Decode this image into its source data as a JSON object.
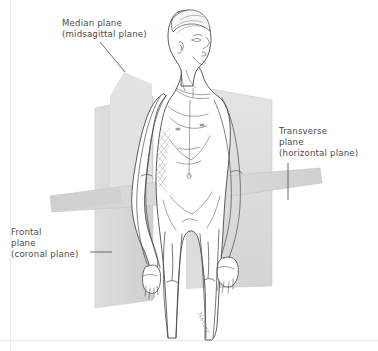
{
  "figure": {
    "background_color": "#ffffff",
    "plane_fill_color": "#d9d9d9",
    "outline_color": "#3a3a3a",
    "label_color": "#4a4a4a",
    "border_color": "#ebebeb",
    "signature": "Netter"
  },
  "labels": {
    "median": {
      "line1": "Median plane",
      "line2": "(midsagittal plane)",
      "leader": "diagonal-line-down-right"
    },
    "transverse": {
      "line1": "Transverse",
      "line2": "plane",
      "line3": "(horizontal plane)",
      "leader": "vertical-line-down"
    },
    "frontal": {
      "line1": "Frontal",
      "line2": "plane",
      "line3": "(coronal plane)",
      "leader": "horizontal-line-right"
    }
  },
  "planes": [
    {
      "name": "median-plane",
      "alt_name": "midsagittal plane",
      "orientation": "vertical sagittal",
      "divides": "left and right halves"
    },
    {
      "name": "frontal-plane",
      "alt_name": "coronal plane",
      "orientation": "vertical coronal",
      "divides": "anterior and posterior"
    },
    {
      "name": "transverse-plane",
      "alt_name": "horizontal plane",
      "orientation": "horizontal",
      "divides": "superior and inferior"
    }
  ]
}
